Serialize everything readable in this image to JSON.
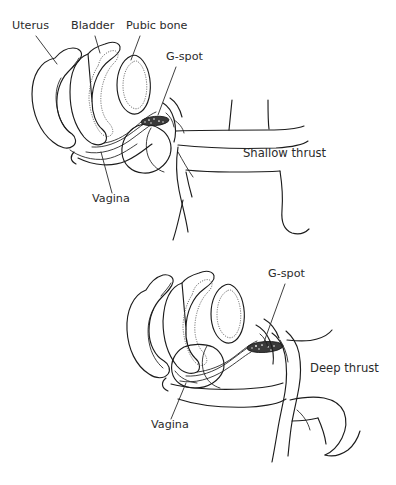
{
  "figure": {
    "background_color": "#ffffff",
    "line_color": "#1c1c1c",
    "text_color": "#2b2b2b",
    "gspot_color": "#3a3a3a",
    "width": 396,
    "height": 485
  },
  "panels": [
    {
      "id": "shallow",
      "name": "shallow-thrust-panel",
      "thrust_label": "Shallow thrust",
      "labels": [
        {
          "key": "uterus",
          "text": "Uterus",
          "x": 12,
          "y": 29,
          "has_leader": true
        },
        {
          "key": "bladder",
          "text": "Bladder",
          "x": 71,
          "y": 29,
          "has_leader": true
        },
        {
          "key": "pubic_bone",
          "text": "Pubic bone",
          "x": 126,
          "y": 29,
          "has_leader": true
        },
        {
          "key": "gspot",
          "text": "G-spot",
          "x": 166,
          "y": 60,
          "has_leader": true
        },
        {
          "key": "vagina",
          "text": "Vagina",
          "x": 92,
          "y": 202,
          "has_leader": true
        },
        {
          "key": "thrust",
          "text": "Shallow thrust",
          "x": 243,
          "y": 157,
          "has_leader": false
        }
      ]
    },
    {
      "id": "deep",
      "name": "deep-thrust-panel",
      "thrust_label": "Deep thrust",
      "labels": [
        {
          "key": "gspot",
          "text": "G-spot",
          "x": 268,
          "y": 277,
          "has_leader": true
        },
        {
          "key": "vagina",
          "text": "Vagina",
          "x": 151,
          "y": 428,
          "has_leader": true
        },
        {
          "key": "thrust",
          "text": "Deep thrust",
          "x": 310,
          "y": 372,
          "has_leader": false
        }
      ]
    }
  ],
  "anatomy_parts": [
    "uterus",
    "bladder",
    "pubic-bone",
    "vagina",
    "g-spot",
    "penis",
    "body-outline"
  ]
}
